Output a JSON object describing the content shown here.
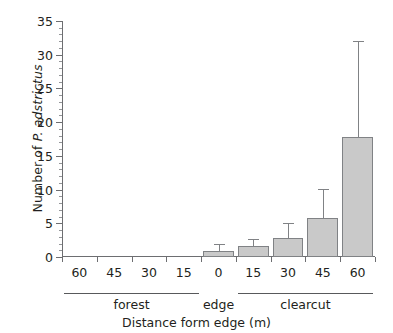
{
  "chart_data": {
    "type": "bar",
    "title": "",
    "xlabel": "Distance form edge (m)",
    "ylabel_prefix": "Number of ",
    "ylabel_species": "P. adstrictus",
    "ylabel_full": "Number of P. adstrictus",
    "categories": [
      "60",
      "45",
      "30",
      "15",
      "0",
      "15",
      "30",
      "45",
      "60"
    ],
    "values": [
      0,
      0,
      0,
      0,
      0.9,
      1.7,
      2.8,
      5.8,
      17.8
    ],
    "errors_upper": [
      0,
      0,
      0,
      0,
      1.0,
      0.9,
      2.2,
      4.3,
      14.2
    ],
    "error_tops": [
      0,
      0,
      0,
      0,
      1.9,
      2.6,
      5.0,
      10.1,
      32.0
    ],
    "ylim": [
      0,
      35
    ],
    "ytick_values": [
      0,
      5,
      10,
      15,
      20,
      25,
      30,
      35
    ],
    "ytick_labels": [
      "0",
      "5",
      "10",
      "15",
      "20",
      "25",
      "30",
      "35"
    ],
    "yminor_step": 1,
    "grid": false,
    "legend": false,
    "bar_color": "#c9c9c9",
    "bar_border_color": "#808285",
    "axis_color": "#6d6e71",
    "groups": [
      {
        "label": "forest",
        "start_index": 0,
        "end_index": 3
      },
      {
        "label": "edge",
        "start_index": 4,
        "end_index": 4
      },
      {
        "label": "clearcut",
        "start_index": 5,
        "end_index": 8
      }
    ],
    "group_brackets": [
      {
        "label": "forest",
        "show_line": true
      },
      {
        "label": "edge",
        "show_line": false
      },
      {
        "label": "clearcut",
        "show_line": true
      }
    ]
  }
}
